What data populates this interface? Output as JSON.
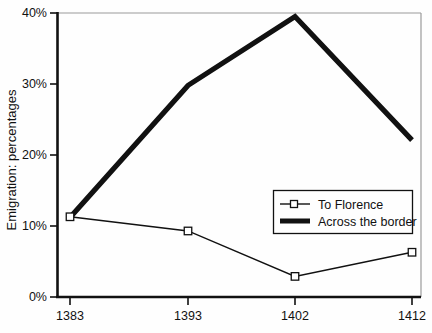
{
  "chart_data": {
    "type": "line",
    "title": "",
    "xlabel": "",
    "ylabel": "Emigration: percentages",
    "categories": [
      "1383",
      "1393",
      "1402",
      "1412"
    ],
    "x": [
      1383,
      1393,
      1402,
      1412
    ],
    "xlim": [
      1383,
      1412
    ],
    "ylim": [
      0,
      40
    ],
    "yticks": [
      "0%",
      "10%",
      "20%",
      "30%",
      "40%"
    ],
    "ytick_values": [
      0,
      10,
      20,
      30,
      40
    ],
    "grid": false,
    "legend_position": "center-right",
    "series": [
      {
        "name": "To Florence",
        "marker": "open-square",
        "line_weight": "thin",
        "color": "#000000",
        "values": [
          11.3,
          9.3,
          2.9,
          6.3
        ]
      },
      {
        "name": "Across the border",
        "marker": "none",
        "line_weight": "thick",
        "color": "#111111",
        "values": [
          11.2,
          29.8,
          39.5,
          22.1
        ]
      }
    ]
  },
  "legend": {
    "entries": [
      {
        "label": "To Florence",
        "style": "thin-line-open-square"
      },
      {
        "label": "Across the border",
        "style": "thick-line"
      }
    ]
  },
  "axes": {
    "y_title": "Emigration: percentages",
    "y_tick_labels": [
      "40%",
      "30%",
      "20%",
      "10%",
      "0%"
    ],
    "x_tick_labels": [
      "1383",
      "1393",
      "1402",
      "1412"
    ]
  },
  "colors": {
    "ink": "#111111",
    "frame": "#8d8d8d",
    "background": "#fefefe"
  }
}
